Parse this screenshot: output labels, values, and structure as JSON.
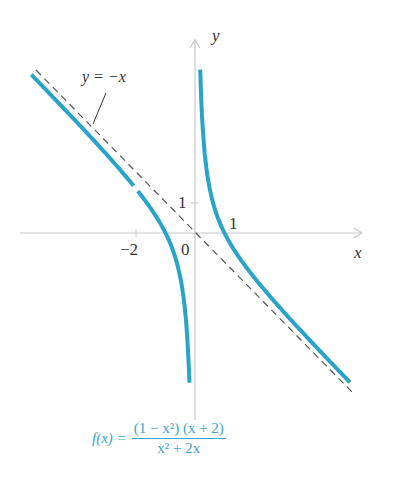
{
  "chart_data": {
    "type": "line",
    "title": "",
    "function": "f(x) = (1 - x^2)(x + 2) / (x^2 + 2x)",
    "xlabel": "x",
    "ylabel": "y",
    "xlim": [
      -5.5,
      5.2
    ],
    "ylim": [
      -5.2,
      6.2
    ],
    "grid": false,
    "ticks": {
      "x": [
        "-2",
        "0",
        "1"
      ],
      "y": [
        "1"
      ]
    },
    "series": [
      {
        "name": "f(x) left branch",
        "color": "#2aa3c8",
        "points_x_lt_0": true,
        "hole": [
          -2,
          1.5
        ]
      },
      {
        "name": "f(x) right branch",
        "color": "#2aa3c8",
        "points_x_gt_0": true
      },
      {
        "name": "y = -x",
        "style": "dashed",
        "color": "#444444"
      }
    ],
    "annotations": [
      "y = −x"
    ],
    "key_points": [
      [
        1,
        0
      ],
      [
        -1,
        0
      ]
    ],
    "vertical_asymptote": "x = 0",
    "slant_asymptote": "y = -x"
  },
  "labels": {
    "y_axis": "y",
    "x_axis": "x",
    "tick_neg2": "−2",
    "tick_0": "0",
    "tick_y1": "1",
    "tick_x1": "1",
    "asymptote": "y = −x"
  },
  "formula": {
    "lhs": "f(x) =",
    "numerator": "(1 − x²) (x + 2)",
    "denominator": "x² + 2x"
  }
}
